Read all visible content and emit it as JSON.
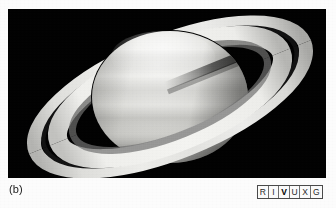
{
  "figure": {
    "panel_label": "(b)",
    "background_color": "#020202",
    "page_color": "#fcfcfc"
  },
  "photo": {
    "alt": "saturn-photograph",
    "frame": {
      "left": 8,
      "top": 9,
      "width": 318,
      "height": 169
    },
    "planet": {
      "name": "Saturn",
      "center_x": 162,
      "center_y": 88,
      "radius_x": 78,
      "radius_y": 66,
      "highlight_color": "#f2f2f0",
      "mid_color": "#c9c9c6",
      "limb_color": "#8e8e8c"
    },
    "rings": {
      "outer_a_ring_color": "#d8d8d5",
      "b_ring_color": "#e8e8e5",
      "cassini_division_color": "#1d1d1d",
      "tilt_degrees": -22,
      "outer_semi_major": 148,
      "outer_semi_minor": 58,
      "left_tip_x": 16,
      "right_tip_x": 302
    }
  },
  "wavelength_legend": {
    "name": "RIVUXG wavelength indicator",
    "active_band": "V",
    "bands": [
      {
        "code": "R",
        "label": "Radio",
        "active": false
      },
      {
        "code": "I",
        "label": "Infrared",
        "active": false
      },
      {
        "code": "V",
        "label": "Visible",
        "active": true
      },
      {
        "code": "U",
        "label": "Ultraviolet",
        "active": false
      },
      {
        "code": "X",
        "label": "X-ray",
        "active": false
      },
      {
        "code": "G",
        "label": "Gamma ray",
        "active": false
      }
    ],
    "border_color": "#4a4a4a",
    "background_color": "#fbfbfb"
  }
}
